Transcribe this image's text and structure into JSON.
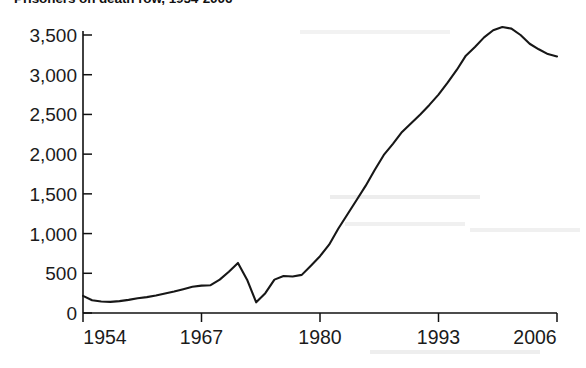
{
  "chart_data": {
    "type": "line",
    "title": "Prisoners on death row, 1954-2006",
    "xlabel": "",
    "ylabel": "",
    "xlim": [
      1954,
      2006
    ],
    "ylim": [
      0,
      3750
    ],
    "grid": false,
    "legend": null,
    "x_ticks": [
      "1954",
      "1967",
      "1980",
      "1993",
      "2006"
    ],
    "y_ticks": [
      "0",
      "500",
      "1,000",
      "1,500",
      "2,000",
      "2,500",
      "3,000",
      "3,500"
    ],
    "series": [
      {
        "name": "Prisoners on death row",
        "x": [
          1954,
          1955,
          1956,
          1957,
          1958,
          1959,
          1960,
          1961,
          1962,
          1963,
          1964,
          1965,
          1966,
          1967,
          1968,
          1969,
          1970,
          1971,
          1972,
          1973,
          1974,
          1975,
          1976,
          1977,
          1978,
          1979,
          1980,
          1981,
          1982,
          1983,
          1984,
          1985,
          1986,
          1987,
          1988,
          1989,
          1990,
          1991,
          1992,
          1993,
          1994,
          1995,
          1996,
          1997,
          1998,
          1999,
          2000,
          2001,
          2002,
          2003,
          2004,
          2005,
          2006
        ],
        "values": [
          215,
          160,
          145,
          140,
          150,
          165,
          185,
          200,
          220,
          245,
          270,
          300,
          330,
          345,
          350,
          420,
          520,
          630,
          420,
          134,
          250,
          420,
          465,
          460,
          480,
          595,
          715,
          860,
          1060,
          1240,
          1420,
          1600,
          1800,
          1990,
          2130,
          2280,
          2390,
          2500,
          2620,
          2750,
          2900,
          3060,
          3240,
          3350,
          3470,
          3560,
          3600,
          3580,
          3500,
          3390,
          3320,
          3260,
          3230
        ]
      }
    ],
    "annotations": [
      "Sharp decline 1972-1973 following Furman v. Georgia",
      "Peak near 3,600 around 2000",
      "Decline to about 3,230 by 2006"
    ]
  },
  "ghost_text": {
    "row1": "",
    "row2": "",
    "row3": ""
  }
}
